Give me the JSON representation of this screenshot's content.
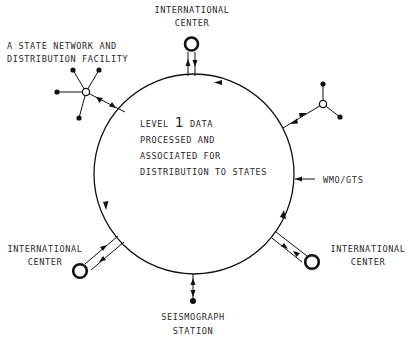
{
  "diagram": {
    "hub": {
      "lines": [
        "LEVEL 1 DATA",
        "PROCESSED AND",
        "ASSOCIATED FOR",
        "DISTRIBUTION TO STATES"
      ],
      "level_prefix": "LEVEL",
      "level_number": "1",
      "level_suffix": "DATA"
    },
    "nodes": {
      "intl_top": {
        "line1": "INTERNATIONAL",
        "line2": "CENTER"
      },
      "state_network": {
        "line1": "A STATE NETWORK AND",
        "line2": "DISTRIBUTION FACILITY"
      },
      "wmo": {
        "label": "WMO/GTS"
      },
      "intl_left": {
        "line1": "INTERNATIONAL",
        "line2": "CENTER"
      },
      "intl_right": {
        "line1": "INTERNATIONAL",
        "line2": "CENTER"
      },
      "seismograph": {
        "line1": "SEISMOGRAPH",
        "line2": "STATION"
      }
    },
    "colors": {
      "ink": "#111111",
      "text": "#2a2a2a",
      "background": "#ffffff"
    }
  }
}
